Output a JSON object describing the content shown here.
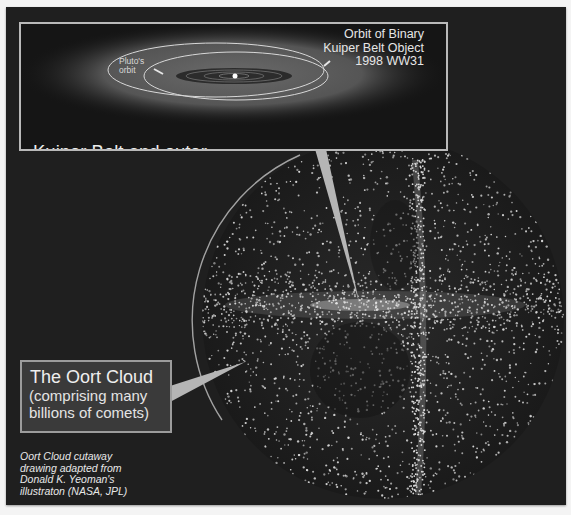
{
  "figure": {
    "colors": {
      "background": "#1f1f1f",
      "border": "#f4f4f4",
      "label_box": "#3a3a3a",
      "label_border": "#9c9c9c",
      "text": "#ececec",
      "pointer": "#b5b5b5",
      "dots": "#d8d8d8"
    }
  },
  "kuiper_inset": {
    "title_line1": "Kuiper Belt and outer",
    "title_line2": " solar  system planetary orbits",
    "binary_label_line1": "Orbit of Binary",
    "binary_label_line2": "Kuiper Belt Object",
    "binary_label_line3": "1998 WW31",
    "pluto_label_line1": "Pluto's",
    "pluto_label_line2": "orbit"
  },
  "oort_label": {
    "title": "The Oort Cloud",
    "sub_line1": "(comprising many",
    "sub_line2": "billions of comets)"
  },
  "credit": {
    "line1": "Oort Cloud cutaway",
    "line2": "drawing adapted from",
    "line3": "Donald K. Yeoman's",
    "line4": "illustraton (NASA, JPL)"
  }
}
